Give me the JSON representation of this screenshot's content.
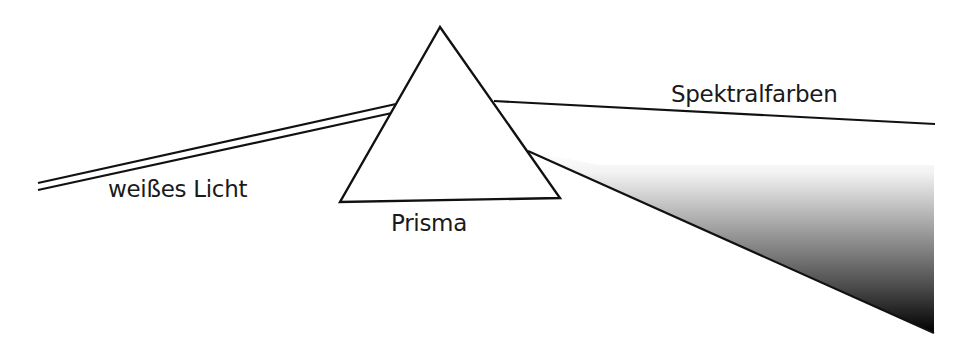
{
  "diagram": {
    "type": "optics-dispersion",
    "labels": {
      "white_light": "weißes Licht",
      "prism": "Prisma",
      "spectral_colors": "Spektralfarben"
    },
    "colors": {
      "line": "#111111",
      "background": "#ffffff",
      "gradient_start": "#ffffff",
      "gradient_end": "#000000"
    }
  }
}
